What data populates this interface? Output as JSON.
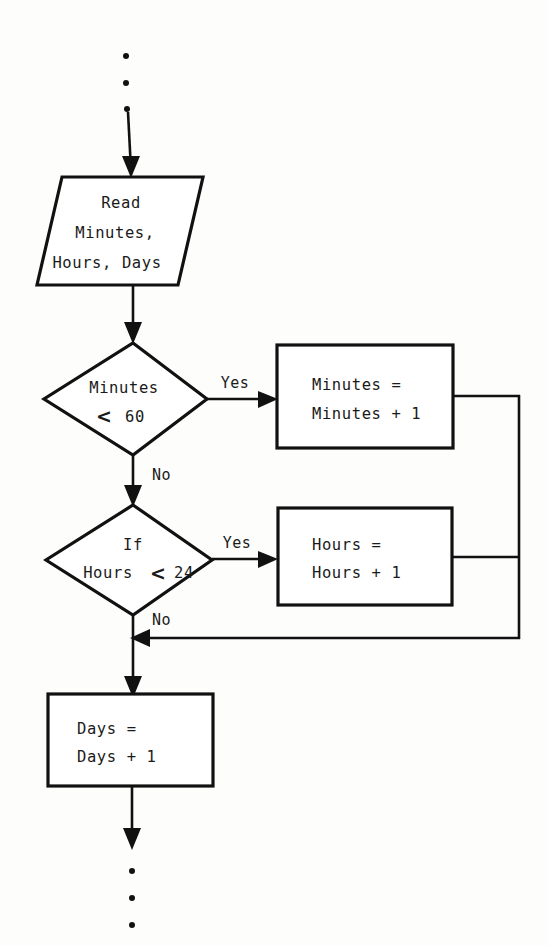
{
  "diagram": {
    "background_color": "#fdfdfc",
    "line_color": "#111111",
    "text_color": "#1a1a1a",
    "nodes": {
      "top_ellipsis": {
        "label": "...",
        "dots": 3
      },
      "read_io": {
        "shape": "parallelogram",
        "line1": "Read",
        "line2": "Minutes,",
        "line3": "Hours, Days"
      },
      "decision_minutes": {
        "shape": "diamond",
        "line1": "Minutes",
        "comparator": "<",
        "value": "60"
      },
      "process_minutes": {
        "shape": "rectangle",
        "line1": "Minutes =",
        "line2": "Minutes + 1"
      },
      "decision_hours": {
        "shape": "diamond",
        "line1": "If",
        "line2_prefix": "Hours",
        "comparator": "<",
        "value": "24"
      },
      "process_hours": {
        "shape": "rectangle",
        "line1": "Hours =",
        "line2": "Hours + 1"
      },
      "process_days": {
        "shape": "rectangle",
        "line1": "Days =",
        "line2": "Days + 1"
      },
      "bottom_ellipsis": {
        "label": "...",
        "dots": 3
      }
    },
    "edge_labels": {
      "minutes_yes": "Yes",
      "minutes_no": "No",
      "hours_yes": "Yes",
      "hours_no": "No"
    }
  }
}
